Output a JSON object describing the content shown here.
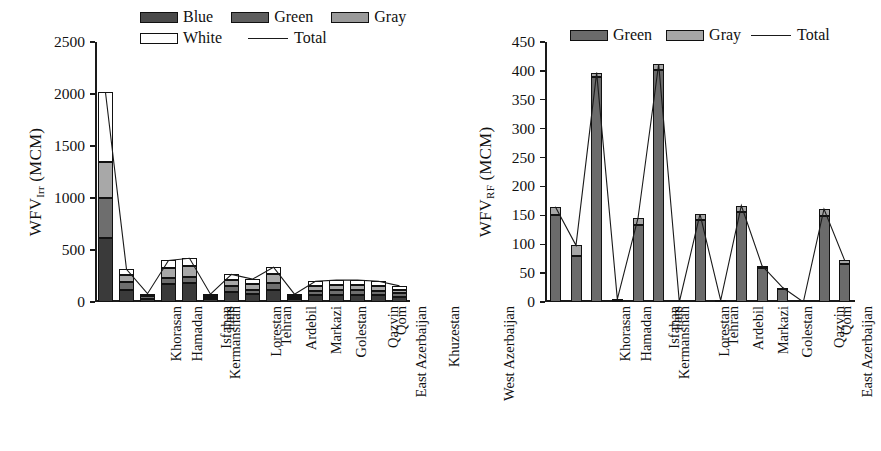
{
  "figure": {
    "background": "#ffffff",
    "width": 881,
    "height": 451
  },
  "panels": [
    {
      "id": "left",
      "ytitle_main": "WFV",
      "ytitle_sub": "Irr",
      "ytitle_unit": " (MCM)"
    },
    {
      "id": "right",
      "ytitle_main": "WFV",
      "ytitle_sub": "RF",
      "ytitle_unit": " (MCM)"
    }
  ],
  "legend_left": {
    "items": [
      {
        "label": "Blue",
        "swatch": "blue",
        "type": "patch"
      },
      {
        "label": "Green",
        "swatch": "green",
        "type": "patch"
      },
      {
        "label": "Gray",
        "swatch": "gray",
        "type": "patch"
      },
      {
        "label": "White",
        "swatch": "white",
        "type": "patch"
      },
      {
        "label": "Total",
        "swatch": "line",
        "type": "line"
      }
    ]
  },
  "legend_right": {
    "items": [
      {
        "label": "Green",
        "swatch": "rgreen",
        "type": "patch"
      },
      {
        "label": "Gray",
        "swatch": "rgray",
        "type": "patch"
      },
      {
        "label": "Total",
        "swatch": "line",
        "type": "line"
      }
    ]
  },
  "chart_data": [
    {
      "type": "bar",
      "id": "wfv-irr",
      "title": "",
      "xlabel": "",
      "ylabel": "WFV_Irr (MCM)",
      "ylim": [
        0,
        2500
      ],
      "yticks": [
        0,
        500,
        1000,
        1500,
        2000,
        2500
      ],
      "grid": false,
      "stacked": true,
      "legend_position": "top-center",
      "categories": [
        "Khorasan",
        "Hamadan",
        "Kermanshah",
        "Isfahan",
        "Fars",
        "Lorestan",
        "Tehran",
        "Ardebil",
        "Markazi",
        "Golestan",
        "East Azerbaijan",
        "Qazvin",
        "Qom",
        "Khuzestan",
        "West Azerbaijan"
      ],
      "series": [
        {
          "name": "Blue",
          "values": [
            620,
            120,
            30,
            175,
            185,
            25,
            95,
            75,
            115,
            25,
            65,
            70,
            70,
            65,
            50
          ]
        },
        {
          "name": "Green",
          "values": [
            380,
            75,
            25,
            55,
            60,
            20,
            60,
            45,
            70,
            18,
            45,
            45,
            45,
            45,
            35
          ]
        },
        {
          "name": "Gray",
          "values": [
            350,
            60,
            15,
            95,
            100,
            15,
            55,
            55,
            80,
            17,
            45,
            50,
            50,
            45,
            35
          ]
        },
        {
          "name": "White",
          "values": [
            665,
            60,
            10,
            75,
            75,
            15,
            55,
            45,
            70,
            15,
            45,
            45,
            45,
            45,
            35
          ]
        }
      ],
      "total": {
        "name": "Total",
        "values": [
          2015,
          315,
          80,
          400,
          420,
          75,
          265,
          220,
          335,
          75,
          200,
          210,
          210,
          200,
          155
        ]
      }
    },
    {
      "type": "bar",
      "id": "wfv-rf",
      "title": "",
      "xlabel": "",
      "ylabel": "WFV_RF (MCM)",
      "ylim": [
        0,
        450
      ],
      "yticks": [
        0,
        50,
        100,
        150,
        200,
        250,
        300,
        350,
        400,
        450
      ],
      "grid": false,
      "stacked": true,
      "legend_position": "top-center",
      "categories": [
        "Khorasan",
        "Hamadan",
        "Kermanshah",
        "Isfahan",
        "Fars",
        "Lorestan",
        "Tehran",
        "Ardebil",
        "Markazi",
        "Golestan",
        "East Azerbaijan",
        "Qazvin",
        "Qom",
        "Khuzestan",
        "West Azerbaijan"
      ],
      "series": [
        {
          "name": "Green",
          "values": [
            150,
            80,
            390,
            4,
            133,
            402,
            0,
            142,
            3,
            155,
            58,
            22,
            0,
            148,
            66
          ]
        },
        {
          "name": "Gray",
          "values": [
            15,
            18,
            7,
            1,
            12,
            10,
            0,
            10,
            0,
            12,
            5,
            3,
            0,
            13,
            6
          ]
        }
      ],
      "total": {
        "name": "Total",
        "values": [
          165,
          98,
          397,
          5,
          145,
          412,
          0,
          152,
          3,
          167,
          63,
          25,
          0,
          161,
          72
        ]
      }
    }
  ]
}
